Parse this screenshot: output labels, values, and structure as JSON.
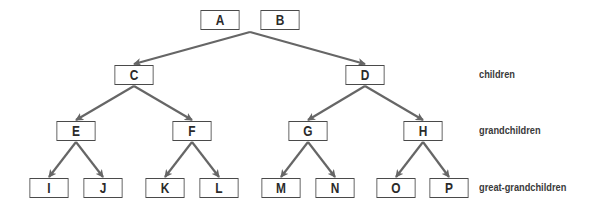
{
  "diagram": {
    "type": "tree",
    "colors": {
      "edge": "#666666",
      "node_border": "#4a4a4a",
      "node_text": "#2b2b2b",
      "label_text": "#3a3a3a",
      "background": "#ffffff"
    },
    "nodes": {
      "A": {
        "label": "A",
        "x": 197,
        "y": 10,
        "w": 46,
        "h": 20
      },
      "B": {
        "label": "B",
        "x": 257,
        "y": 10,
        "w": 46,
        "h": 20
      },
      "C": {
        "label": "C",
        "x": 111,
        "y": 65,
        "w": 46,
        "h": 20
      },
      "D": {
        "label": "D",
        "x": 342,
        "y": 65,
        "w": 46,
        "h": 20
      },
      "E": {
        "label": "E",
        "x": 53,
        "y": 121,
        "w": 46,
        "h": 20
      },
      "F": {
        "label": "F",
        "x": 169,
        "y": 121,
        "w": 46,
        "h": 20
      },
      "G": {
        "label": "G",
        "x": 285,
        "y": 121,
        "w": 46,
        "h": 20
      },
      "H": {
        "label": "H",
        "x": 400,
        "y": 121,
        "w": 46,
        "h": 20
      },
      "I": {
        "label": "I",
        "x": 26,
        "y": 178,
        "w": 46,
        "h": 20
      },
      "J": {
        "label": "J",
        "x": 80,
        "y": 178,
        "w": 46,
        "h": 20
      },
      "K": {
        "label": "K",
        "x": 142,
        "y": 178,
        "w": 46,
        "h": 20
      },
      "L": {
        "label": "L",
        "x": 196,
        "y": 178,
        "w": 46,
        "h": 20
      },
      "M": {
        "label": "M",
        "x": 258,
        "y": 178,
        "w": 46,
        "h": 20
      },
      "N": {
        "label": "N",
        "x": 312,
        "y": 178,
        "w": 46,
        "h": 20
      },
      "O": {
        "label": "O",
        "x": 373,
        "y": 178,
        "w": 46,
        "h": 20
      },
      "P": {
        "label": "P",
        "x": 426,
        "y": 178,
        "w": 46,
        "h": 20
      }
    },
    "edges": [
      {
        "from": "AB",
        "to": "C",
        "x1": 250,
        "y1": 32,
        "x2": 134,
        "y2": 64
      },
      {
        "from": "AB",
        "to": "D",
        "x1": 250,
        "y1": 32,
        "x2": 365,
        "y2": 64
      },
      {
        "from": "C",
        "to": "E",
        "x1": 134,
        "y1": 86,
        "x2": 76,
        "y2": 120
      },
      {
        "from": "C",
        "to": "F",
        "x1": 134,
        "y1": 86,
        "x2": 192,
        "y2": 120
      },
      {
        "from": "D",
        "to": "G",
        "x1": 365,
        "y1": 86,
        "x2": 308,
        "y2": 120
      },
      {
        "from": "D",
        "to": "H",
        "x1": 365,
        "y1": 86,
        "x2": 423,
        "y2": 120
      },
      {
        "from": "E",
        "to": "I",
        "x1": 76,
        "y1": 142,
        "x2": 49,
        "y2": 177
      },
      {
        "from": "E",
        "to": "J",
        "x1": 76,
        "y1": 142,
        "x2": 103,
        "y2": 177
      },
      {
        "from": "F",
        "to": "K",
        "x1": 192,
        "y1": 142,
        "x2": 165,
        "y2": 177
      },
      {
        "from": "F",
        "to": "L",
        "x1": 192,
        "y1": 142,
        "x2": 219,
        "y2": 177
      },
      {
        "from": "G",
        "to": "M",
        "x1": 308,
        "y1": 142,
        "x2": 281,
        "y2": 177
      },
      {
        "from": "G",
        "to": "N",
        "x1": 308,
        "y1": 142,
        "x2": 335,
        "y2": 177
      },
      {
        "from": "H",
        "to": "O",
        "x1": 423,
        "y1": 142,
        "x2": 396,
        "y2": 177
      },
      {
        "from": "H",
        "to": "P",
        "x1": 423,
        "y1": 142,
        "x2": 449,
        "y2": 177
      }
    ],
    "level_labels": {
      "children": {
        "text": "children",
        "x": 479,
        "y": 68
      },
      "grandchildren": {
        "text": "grandchildren",
        "x": 479,
        "y": 124
      },
      "great_grandchildren": {
        "text": "great-grandchildren",
        "x": 479,
        "y": 181
      }
    }
  }
}
